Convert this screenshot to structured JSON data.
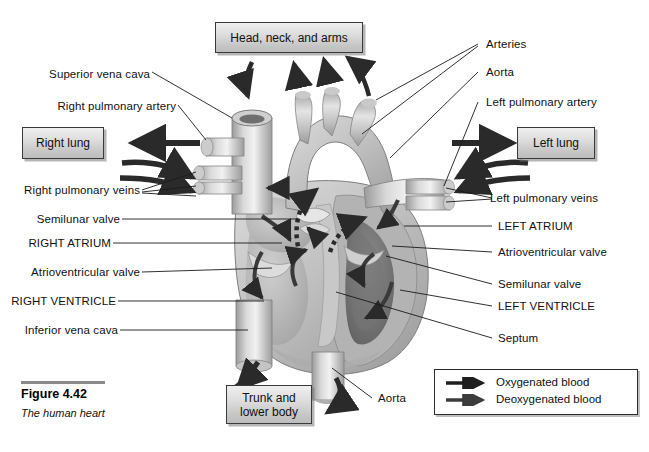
{
  "figure": {
    "number": "Figure 4.42",
    "caption": "The human heart"
  },
  "boxes": {
    "head": "Head, neck, and arms",
    "right_lung": "Right lung",
    "left_lung": "Left lung",
    "trunk_line1": "Trunk and",
    "trunk_line2": "lower body"
  },
  "labels_left": [
    "Superior vena cava",
    "Right pulmonary artery",
    "Right pulmonary veins",
    "Semilunar valve",
    "RIGHT ATRIUM",
    "Atrioventricular valve",
    "RIGHT VENTRICLE",
    "Inferior vena cava"
  ],
  "labels_right": [
    "Arteries",
    "Aorta",
    "Left pulmonary artery",
    "Left pulmonary veins",
    "LEFT ATRIUM",
    "Atrioventricular valve",
    "Semilunar valve",
    "LEFT VENTRICLE",
    "Septum"
  ],
  "labels_bottom": [
    "Aorta"
  ],
  "legend": {
    "oxygenated": "Oxygenated blood",
    "deoxygenated": "Deoxygenated blood"
  },
  "colors": {
    "ink": "#111111",
    "arrow_dark": "#2a2a2a",
    "arrow_mid": "#4a4a4a",
    "box_border": "#3a3a3a",
    "tissue_light": "#d7d7d7",
    "tissue_mid": "#b4b4b4",
    "tissue_dark": "#8f8f8f",
    "chamber_dark": "#6e6e6e"
  }
}
